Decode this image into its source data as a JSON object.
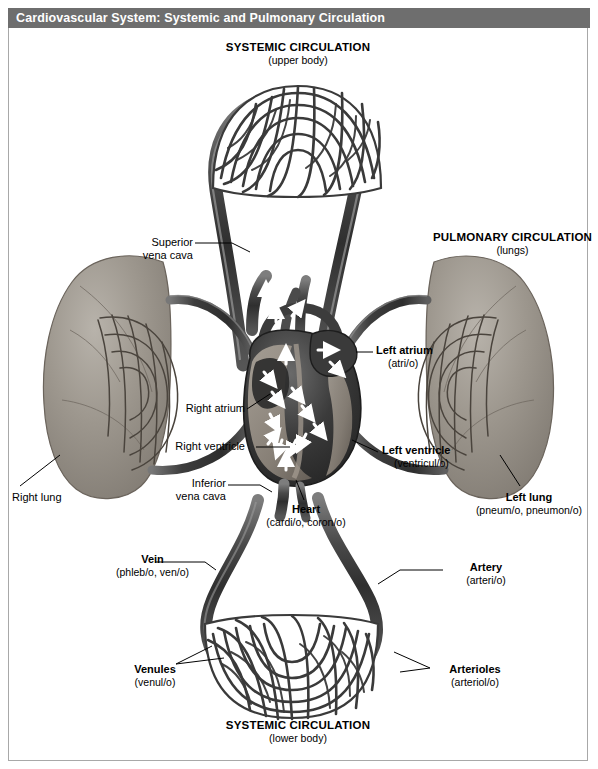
{
  "title": {
    "text": "Cardiovascular System: Systemic and Pulmonary Circulation",
    "bar_color": "#6e6e6e",
    "text_color": "#ffffff"
  },
  "diagram": {
    "type": "anatomical-illustration",
    "background": "#ffffff"
  },
  "labels": {
    "systemic_upper": {
      "name": "SYSTEMIC CIRCULATION",
      "detail": "(upper body)"
    },
    "systemic_lower": {
      "name": "SYSTEMIC CIRCULATION",
      "detail": "(lower body)"
    },
    "pulmonary": {
      "name": "PULMONARY CIRCULATION",
      "detail": "(lungs)"
    },
    "superior_vena_cava": {
      "name": "Superior",
      "detail": "vena cava"
    },
    "inferior_vena_cava": {
      "name": "Inferior",
      "detail": "vena cava"
    },
    "left_atrium": {
      "name": "Left atrium",
      "detail": "(atri/o)"
    },
    "right_atrium": {
      "name": "Right atrium",
      "detail": ""
    },
    "left_ventricle": {
      "name": "Left ventricle",
      "detail": "(ventricul/o)"
    },
    "right_ventricle": {
      "name": "Right ventricle",
      "detail": ""
    },
    "heart": {
      "name": "Heart",
      "detail": "(cardi/o, coron/o)"
    },
    "right_lung": {
      "name": "Right lung",
      "detail": ""
    },
    "left_lung": {
      "name": "Left lung",
      "detail": "(pneum/o, pneumon/o)"
    },
    "vein": {
      "name": "Vein",
      "detail": "(phleb/o, ven/o)"
    },
    "artery": {
      "name": "Artery",
      "detail": "(arteri/o)"
    },
    "venules": {
      "name": "Venules",
      "detail": "(venul/o)"
    },
    "arterioles": {
      "name": "Arterioles",
      "detail": "(arteriol/o)"
    }
  }
}
